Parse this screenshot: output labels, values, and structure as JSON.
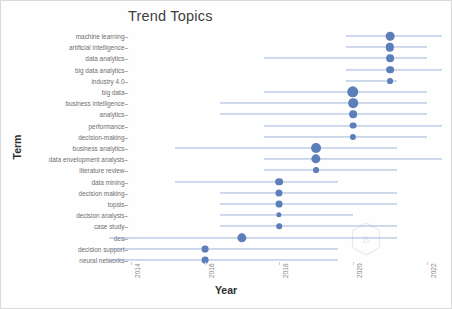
{
  "chart_data": {
    "type": "scatter",
    "title": "Trend Topics",
    "xlabel": "Year",
    "ylabel": "Term",
    "xlim": [
      2013.4,
      2022.4
    ],
    "xticks": [
      2014,
      2016,
      2018,
      2020,
      2022
    ],
    "xticklabels": [
      "2014",
      "2016",
      "2018",
      "2020",
      "2022"
    ],
    "grid": false,
    "legend": false,
    "accent_color": "#5d7fb9",
    "line_color": "#8fa9d4",
    "watermark": "bibliometrix-hexagon-logo",
    "categories": [
      "machine learning",
      "artificial intelligence",
      "data analytics",
      "big data analytics",
      "industry 4.0",
      "big data",
      "business intelligence",
      "analytics",
      "performance",
      "decision-making",
      "business analytics",
      "data envelopment analysis",
      "literature review",
      "data mining",
      "decision making",
      "topsis",
      "decision analysis",
      "case study",
      "dea",
      "decision support",
      "neural networks"
    ],
    "points": [
      {
        "term": "machine learning",
        "median": 2021.0,
        "q1": 2019.8,
        "q3": 2022.4,
        "size": 5.6
      },
      {
        "term": "artificial intelligence",
        "median": 2021.0,
        "q1": 2019.8,
        "q3": 2022.0,
        "size": 5.4
      },
      {
        "term": "data analytics",
        "median": 2021.0,
        "q1": 2017.6,
        "q3": 2022.0,
        "size": 5.0
      },
      {
        "term": "big data analytics",
        "median": 2021.0,
        "q1": 2019.8,
        "q3": 2022.4,
        "size": 5.0
      },
      {
        "term": "industry 4.0",
        "median": 2021.0,
        "q1": 2019.8,
        "q3": 2021.2,
        "size": 3.8
      },
      {
        "term": "big data",
        "median": 2020.0,
        "q1": 2017.6,
        "q3": 2022.0,
        "size": 7.4
      },
      {
        "term": "business intelligence",
        "median": 2020.0,
        "q1": 2016.4,
        "q3": 2022.0,
        "size": 6.2
      },
      {
        "term": "analytics",
        "median": 2020.0,
        "q1": 2016.4,
        "q3": 2022.0,
        "size": 5.0
      },
      {
        "term": "performance",
        "median": 2020.0,
        "q1": 2017.6,
        "q3": 2022.4,
        "size": 4.4
      },
      {
        "term": "decision-making",
        "median": 2020.0,
        "q1": 2017.6,
        "q3": 2022.0,
        "size": 4.0
      },
      {
        "term": "business analytics",
        "median": 2019.0,
        "q1": 2015.2,
        "q3": 2021.2,
        "size": 6.4
      },
      {
        "term": "data envelopment analysis",
        "median": 2019.0,
        "q1": 2017.6,
        "q3": 2022.4,
        "size": 6.0
      },
      {
        "term": "literature review",
        "median": 2019.0,
        "q1": 2017.6,
        "q3": 2021.2,
        "size": 3.8
      },
      {
        "term": "data mining",
        "median": 2018.0,
        "q1": 2015.2,
        "q3": 2019.6,
        "size": 5.0
      },
      {
        "term": "decision making",
        "median": 2018.0,
        "q1": 2016.4,
        "q3": 2021.2,
        "size": 4.6
      },
      {
        "term": "topsis",
        "median": 2018.0,
        "q1": 2016.4,
        "q3": 2021.2,
        "size": 4.4
      },
      {
        "term": "decision analysis",
        "median": 2018.0,
        "q1": 2016.4,
        "q3": 2020.0,
        "size": 3.4
      },
      {
        "term": "case study",
        "median": 2018.0,
        "q1": 2016.4,
        "q3": 2021.2,
        "size": 3.6
      },
      {
        "term": "dea",
        "median": 2017.0,
        "q1": 2013.4,
        "q3": 2021.2,
        "size": 6.0
      },
      {
        "term": "decision support",
        "median": 2016.0,
        "q1": 2013.4,
        "q3": 2019.6,
        "size": 4.4
      },
      {
        "term": "neural networks",
        "median": 2016.0,
        "q1": 2013.4,
        "q3": 2019.6,
        "size": 4.4
      }
    ]
  }
}
